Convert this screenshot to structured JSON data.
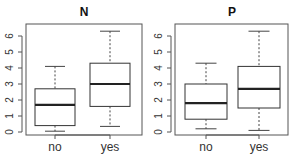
{
  "chart_data": [
    {
      "type": "boxplot",
      "title": "N",
      "xlabel": "",
      "ylabel": "",
      "categories": [
        "no",
        "yes"
      ],
      "yticks": [
        0,
        1,
        2,
        3,
        4,
        5,
        6
      ],
      "ylim": [
        0,
        6.3
      ],
      "grid": false,
      "boxes": [
        {
          "category": "no",
          "whisker_low": 0.05,
          "q1": 0.4,
          "median": 1.7,
          "q3": 2.7,
          "whisker_high": 4.1
        },
        {
          "category": "yes",
          "whisker_low": 0.35,
          "q1": 1.6,
          "median": 3.0,
          "q3": 4.3,
          "whisker_high": 6.3
        }
      ]
    },
    {
      "type": "boxplot",
      "title": "P",
      "xlabel": "",
      "ylabel": "",
      "categories": [
        "no",
        "yes"
      ],
      "yticks": [
        0,
        1,
        2,
        3,
        4,
        5,
        6
      ],
      "ylim": [
        0,
        6.3
      ],
      "grid": false,
      "boxes": [
        {
          "category": "no",
          "whisker_low": 0.2,
          "q1": 0.8,
          "median": 1.8,
          "q3": 3.0,
          "whisker_high": 4.3
        },
        {
          "category": "yes",
          "whisker_low": 0.1,
          "q1": 1.5,
          "median": 2.7,
          "q3": 4.1,
          "whisker_high": 6.3
        }
      ]
    }
  ],
  "colors": {
    "frame": "#555555",
    "box_fill": "#ffffff",
    "median": "#222222"
  }
}
